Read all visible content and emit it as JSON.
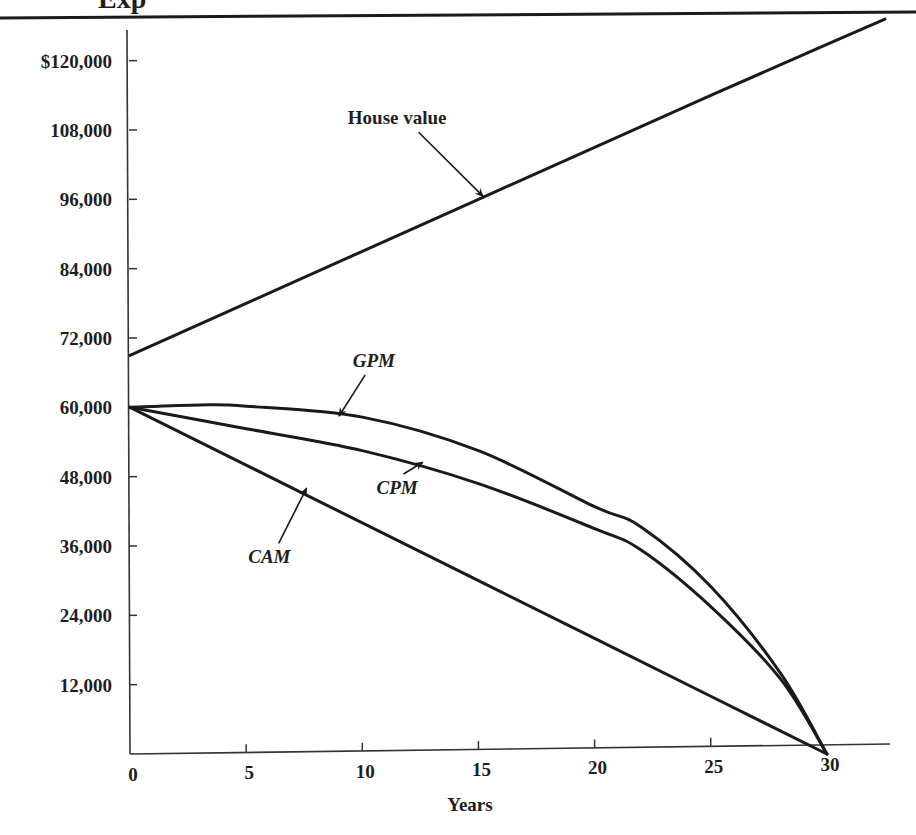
{
  "header": {
    "partial_title": "Exp",
    "rule_color": "#1a1a1a"
  },
  "chart_data": {
    "type": "line",
    "title": "",
    "xlabel": "Years",
    "ylabel": "",
    "xlim": [
      0,
      32.5
    ],
    "ylim": [
      0,
      126000
    ],
    "grid": false,
    "legend": "none (curves labeled with inline annotations and arrows)",
    "x_ticks": [
      0,
      5,
      10,
      15,
      20,
      25,
      30
    ],
    "x_tick_labels": [
      "0",
      "5",
      "10",
      "15",
      "20",
      "25",
      "30"
    ],
    "y_ticks": [
      12000,
      24000,
      36000,
      48000,
      60000,
      72000,
      84000,
      96000,
      108000,
      120000
    ],
    "y_tick_labels": [
      "12,000",
      "24,000",
      "36,000",
      "48,000",
      "60,000",
      "72,000",
      "84,000",
      "96,000",
      "108,000",
      "$120,000"
    ],
    "series": [
      {
        "name": "House value",
        "label_style": "bold",
        "x": [
          0,
          5,
          10,
          15,
          20,
          25,
          30,
          32.5
        ],
        "values": [
          69000,
          78000,
          87000,
          96000,
          105000,
          114000,
          122800,
          127200
        ]
      },
      {
        "name": "GPM",
        "label_style": "bold-italic",
        "x": [
          0,
          3,
          5,
          10,
          15,
          20,
          22,
          25,
          28,
          30
        ],
        "values": [
          60000,
          60400,
          60200,
          58300,
          52500,
          42800,
          39300,
          29000,
          14000,
          0
        ]
      },
      {
        "name": "CPM",
        "label_style": "bold-italic",
        "x": [
          0,
          5,
          10,
          15,
          20,
          22,
          25,
          28,
          30
        ],
        "values": [
          60000,
          56300,
          52500,
          46800,
          39000,
          35300,
          25500,
          13000,
          0
        ]
      },
      {
        "name": "CAM",
        "label_style": "bold-italic",
        "x": [
          0,
          5,
          10,
          15,
          20,
          25,
          30
        ],
        "values": [
          60000,
          50000,
          40000,
          30000,
          20000,
          10000,
          0
        ]
      }
    ],
    "annotations": [
      {
        "text": "House value",
        "points_to_series": "House value",
        "text_at": [
          11.5,
          109000
        ],
        "arrow_to": [
          15.2,
          96500
        ]
      },
      {
        "text": "GPM",
        "points_to_series": "GPM",
        "text_at": [
          10.5,
          67000
        ],
        "arrow_to": [
          9.0,
          58500
        ]
      },
      {
        "text": "CPM",
        "points_to_series": "CPM",
        "text_at": [
          11.5,
          45000
        ],
        "arrow_to": [
          12.6,
          50500
        ]
      },
      {
        "text": "CAM",
        "points_to_series": "CAM",
        "text_at": [
          6.0,
          33000
        ],
        "arrow_to": [
          7.6,
          46000
        ]
      }
    ]
  },
  "style": {
    "line_color": "#1a1a1a",
    "background": "#ffffff"
  }
}
